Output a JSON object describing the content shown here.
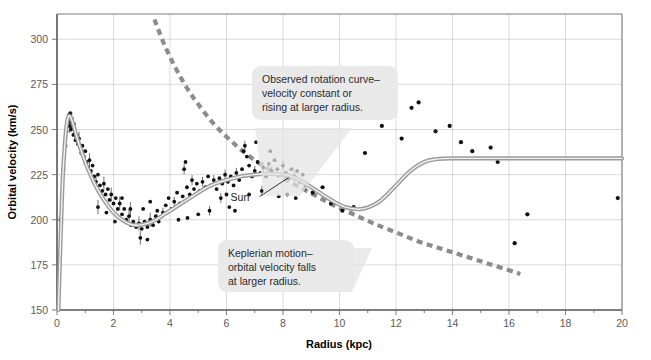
{
  "chart_data": {
    "type": "scatter",
    "title": "",
    "xlabel": "Radius (kpc)",
    "ylabel": "Orbital velocity (km/s)",
    "xlim": [
      0,
      20
    ],
    "ylim": [
      150,
      314
    ],
    "xticks": [
      0,
      2,
      4,
      6,
      8,
      10,
      12,
      14,
      16,
      18,
      20
    ],
    "xtick_labels": [
      "0",
      "2",
      "4",
      "6",
      "8",
      "10",
      "12",
      "14",
      "16",
      "18",
      "20"
    ],
    "xminor_step": 1,
    "yticks": [
      150,
      175,
      200,
      225,
      250,
      275,
      300
    ],
    "ytick_labels": [
      "150",
      "175",
      "200",
      "225",
      "250",
      "275",
      "300"
    ],
    "grid": true,
    "legend": "none",
    "series": [
      {
        "name": "Observed rotation curve",
        "type": "line",
        "style": "solid-gray-band",
        "points": [
          [
            0.05,
            150
          ],
          [
            0.1,
            176
          ],
          [
            0.15,
            200
          ],
          [
            0.2,
            222
          ],
          [
            0.27,
            240
          ],
          [
            0.33,
            251
          ],
          [
            0.4,
            257
          ],
          [
            0.48,
            257
          ],
          [
            0.57,
            253
          ],
          [
            0.68,
            247
          ],
          [
            0.8,
            241
          ],
          [
            0.95,
            234
          ],
          [
            1.1,
            228
          ],
          [
            1.3,
            221
          ],
          [
            1.5,
            215
          ],
          [
            1.75,
            209
          ],
          [
            2.0,
            204
          ],
          [
            2.3,
            200
          ],
          [
            2.6,
            197.5
          ],
          [
            2.9,
            197
          ],
          [
            3.2,
            198
          ],
          [
            3.5,
            200
          ],
          [
            3.8,
            203
          ],
          [
            4.1,
            206
          ],
          [
            4.4,
            209
          ],
          [
            4.8,
            213
          ],
          [
            5.2,
            217
          ],
          [
            5.6,
            220
          ],
          [
            6.0,
            222
          ],
          [
            6.5,
            224
          ],
          [
            7.0,
            225
          ],
          [
            7.5,
            225.5
          ],
          [
            8.0,
            225
          ],
          [
            8.3,
            224
          ],
          [
            8.7,
            221
          ],
          [
            9.2,
            216
          ],
          [
            9.7,
            211
          ],
          [
            10.2,
            207
          ],
          [
            10.8,
            206
          ],
          [
            11.4,
            210
          ],
          [
            12.0,
            219
          ],
          [
            12.5,
            227
          ],
          [
            13.0,
            232
          ],
          [
            13.4,
            233.5
          ],
          [
            14.0,
            234
          ],
          [
            16.0,
            234
          ],
          [
            18.0,
            234
          ],
          [
            20.0,
            234
          ]
        ]
      },
      {
        "name": "Keplerian motion",
        "type": "line",
        "style": "dashed-gray",
        "points": [
          [
            3.45,
            311
          ],
          [
            3.8,
            297
          ],
          [
            4.2,
            284
          ],
          [
            4.6,
            273
          ],
          [
            5.0,
            264
          ],
          [
            5.5,
            254
          ],
          [
            6.0,
            246
          ],
          [
            6.5,
            239
          ],
          [
            7.0,
            233
          ],
          [
            7.5,
            228
          ],
          [
            8.0,
            223
          ],
          [
            8.6,
            218
          ],
          [
            9.2,
            213
          ],
          [
            9.8,
            208
          ],
          [
            10.5,
            203
          ],
          [
            11.2,
            198
          ],
          [
            12.0,
            193
          ],
          [
            12.8,
            188
          ],
          [
            13.6,
            184
          ],
          [
            14.4,
            180
          ],
          [
            15.2,
            176
          ],
          [
            16.0,
            172
          ],
          [
            16.4,
            170
          ]
        ]
      },
      {
        "name": "Measured data points (inner disk)",
        "type": "scatter",
        "points": [
          [
            0.12,
            200
          ],
          [
            0.22,
            228
          ],
          [
            0.3,
            241
          ],
          [
            0.34,
            249
          ],
          [
            0.37,
            252
          ],
          [
            0.4,
            256
          ],
          [
            0.42,
            258
          ],
          [
            0.44,
            255
          ],
          [
            0.45,
            252
          ],
          [
            0.47,
            259
          ],
          [
            0.49,
            254
          ],
          [
            0.5,
            250
          ],
          [
            0.52,
            256
          ],
          [
            0.55,
            251
          ],
          [
            0.58,
            247
          ],
          [
            0.6,
            253
          ],
          [
            0.63,
            248
          ],
          [
            0.66,
            244
          ],
          [
            0.7,
            247
          ],
          [
            0.74,
            242
          ],
          [
            0.78,
            245
          ],
          [
            0.82,
            240
          ],
          [
            0.86,
            237
          ],
          [
            0.9,
            241
          ],
          [
            0.95,
            235
          ],
          [
            1.0,
            238
          ],
          [
            1.05,
            232
          ],
          [
            1.1,
            229
          ],
          [
            1.15,
            233
          ],
          [
            1.2,
            227
          ],
          [
            1.26,
            230
          ],
          [
            1.32,
            224
          ],
          [
            1.38,
            221
          ],
          [
            1.45,
            225
          ],
          [
            1.52,
            219
          ],
          [
            1.6,
            216
          ],
          [
            1.66,
            220
          ],
          [
            1.72,
            214
          ],
          [
            1.8,
            217
          ],
          [
            1.86,
            211
          ],
          [
            1.92,
            214
          ],
          [
            2.0,
            209
          ],
          [
            2.08,
            212
          ],
          [
            2.15,
            206
          ],
          [
            2.22,
            209
          ],
          [
            2.3,
            203
          ],
          [
            2.38,
            206
          ],
          [
            2.45,
            200
          ],
          [
            2.55,
            202
          ],
          [
            2.62,
            197
          ],
          [
            2.7,
            199
          ],
          [
            2.8,
            196
          ],
          [
            2.9,
            198
          ],
          [
            3.0,
            195
          ],
          [
            3.1,
            199
          ],
          [
            3.2,
            196
          ],
          [
            3.3,
            200
          ],
          [
            3.4,
            197
          ],
          [
            3.5,
            202
          ],
          [
            3.6,
            199
          ],
          [
            1.45,
            207
          ],
          [
            1.75,
            204
          ],
          [
            2.05,
            199
          ],
          [
            2.3,
            212
          ],
          [
            2.6,
            206
          ],
          [
            3.05,
            206
          ],
          [
            3.3,
            210
          ],
          [
            3.55,
            205
          ],
          [
            2.95,
            190
          ],
          [
            3.2,
            189
          ]
        ]
      },
      {
        "name": "Measured data points (mid disk)",
        "type": "scatter",
        "points": [
          [
            3.75,
            204
          ],
          [
            3.85,
            208
          ],
          [
            3.95,
            212
          ],
          [
            4.05,
            206
          ],
          [
            4.15,
            210
          ],
          [
            4.25,
            215
          ],
          [
            4.35,
            209
          ],
          [
            4.45,
            213
          ],
          [
            4.5,
            228
          ],
          [
            4.55,
            232
          ],
          [
            4.6,
            218
          ],
          [
            4.7,
            214
          ],
          [
            4.78,
            222
          ],
          [
            4.85,
            217
          ],
          [
            4.95,
            220
          ],
          [
            5.05,
            216
          ],
          [
            5.15,
            221
          ],
          [
            5.25,
            218
          ],
          [
            5.35,
            224
          ],
          [
            5.45,
            219
          ],
          [
            5.55,
            222
          ],
          [
            5.65,
            217
          ],
          [
            5.75,
            223
          ],
          [
            5.85,
            220
          ],
          [
            5.95,
            225
          ],
          [
            6.05,
            221
          ],
          [
            6.15,
            224
          ],
          [
            6.25,
            219
          ],
          [
            6.35,
            226
          ],
          [
            6.45,
            222
          ],
          [
            6.55,
            228
          ],
          [
            6.6,
            238
          ],
          [
            6.65,
            241
          ],
          [
            6.72,
            235
          ],
          [
            6.8,
            230
          ],
          [
            6.9,
            224
          ],
          [
            7.0,
            227
          ],
          [
            7.05,
            243
          ],
          [
            7.1,
            232
          ],
          [
            7.2,
            226
          ],
          [
            7.3,
            229
          ],
          [
            7.4,
            224
          ],
          [
            7.5,
            231
          ],
          [
            7.55,
            238
          ],
          [
            7.6,
            227
          ],
          [
            7.7,
            233
          ],
          [
            7.8,
            228
          ],
          [
            7.9,
            225
          ],
          [
            8.0,
            230
          ],
          [
            8.1,
            226
          ],
          [
            8.2,
            223
          ],
          [
            8.3,
            228
          ],
          [
            8.4,
            224
          ],
          [
            8.5,
            227
          ],
          [
            8.6,
            221
          ],
          [
            8.7,
            225
          ],
          [
            8.8,
            219
          ],
          [
            4.3,
            200
          ],
          [
            4.62,
            201
          ],
          [
            5.0,
            203
          ],
          [
            5.4,
            205
          ],
          [
            6.1,
            207
          ],
          [
            6.3,
            205
          ],
          [
            6.8,
            214
          ],
          [
            7.25,
            216
          ],
          [
            7.85,
            213
          ],
          [
            8.15,
            214
          ],
          [
            8.45,
            212
          ],
          [
            5.8,
            212
          ],
          [
            6.0,
            214
          ]
        ]
      },
      {
        "name": "Measured data points (outer)",
        "type": "scatter",
        "points": [
          [
            9.05,
            215
          ],
          [
            9.4,
            218
          ],
          [
            9.7,
            209
          ],
          [
            10.1,
            205
          ],
          [
            10.5,
            207
          ],
          [
            10.9,
            237
          ],
          [
            11.5,
            252
          ],
          [
            12.2,
            245
          ],
          [
            12.55,
            262
          ],
          [
            12.8,
            265
          ],
          [
            13.4,
            249
          ],
          [
            13.9,
            252
          ],
          [
            14.3,
            243
          ],
          [
            14.7,
            238
          ],
          [
            15.35,
            240
          ],
          [
            15.6,
            232
          ],
          [
            16.2,
            187
          ],
          [
            16.65,
            203
          ],
          [
            19.85,
            212
          ]
        ]
      }
    ],
    "annotations": [
      {
        "name": "observed-callout",
        "lines": [
          "Observed rotation curve–",
          "velocity constant or",
          "rising at larger radius."
        ]
      },
      {
        "name": "keplerian-callout",
        "lines": [
          "Keplerian motion–",
          "orbital velocity falls",
          "at larger radius."
        ]
      },
      {
        "name": "sun-marker",
        "label": "Sun",
        "x": 8.2,
        "y": 225
      }
    ],
    "colors": {
      "observed_curve": "#9a9a9a",
      "kepler_curve": "#8c8c8c",
      "datapoint": "#111111",
      "grid": "#c9c9c9",
      "callout_bg": "#e9e9e9",
      "background": "#ffffff"
    }
  }
}
